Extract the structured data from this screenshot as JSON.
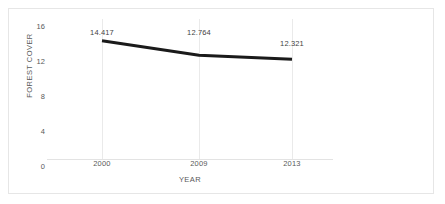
{
  "chart_data": {
    "type": "line",
    "title": "",
    "xlabel": "YEAR",
    "ylabel": "FOREST COVER",
    "categories": [
      "2000",
      "2009",
      "2013"
    ],
    "values": [
      14.417,
      12.764,
      12.321
    ],
    "data_labels": [
      "14.417",
      "12.764",
      "12.321"
    ],
    "ylim": [
      0,
      16
    ],
    "yticks": [
      "0",
      "4",
      "8",
      "12",
      "16"
    ],
    "ytick_values": [
      0,
      4,
      8,
      12,
      16
    ],
    "grid": "vertical-only",
    "legend": "none",
    "series": [
      {
        "name": "Forest Cover",
        "color": "#1a1a1a",
        "values": [
          14.417,
          12.764,
          12.321
        ]
      }
    ]
  },
  "axes": {
    "y_title": "FOREST COVER",
    "x_title": "YEAR",
    "y_ticks": [
      {
        "label": "16",
        "value": 16
      },
      {
        "label": "12",
        "value": 12
      },
      {
        "label": "8",
        "value": 8
      },
      {
        "label": "4",
        "value": 4
      },
      {
        "label": "0",
        "value": 0
      }
    ],
    "x_ticks": [
      {
        "label": "2000"
      },
      {
        "label": "2009"
      },
      {
        "label": "2013"
      }
    ]
  },
  "labels": {
    "point_0": "14.417",
    "point_1": "12.764",
    "point_2": "12.321"
  },
  "colors": {
    "series_line": "#1a1a1a",
    "gridline": "#eaeaea",
    "tick_text": "#595959",
    "label_text": "#3f3f3f",
    "frame_border": "#e6e6e6",
    "background": "#ffffff"
  }
}
